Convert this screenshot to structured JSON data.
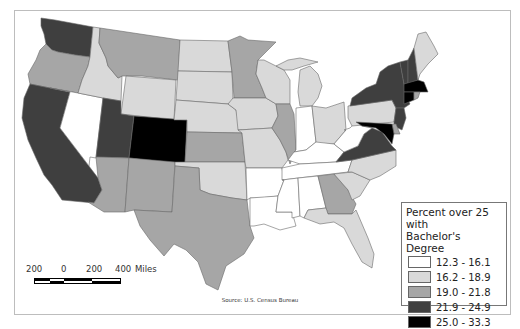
{
  "map": {
    "title_hidden": "",
    "source": "Source: U.S. Census Bureau"
  },
  "legend": {
    "title_line1": "Percent over 25 with",
    "title_line2": "Bachelor's Degree",
    "classes": [
      {
        "label": "12.3 - 16.1",
        "color": "#ffffff"
      },
      {
        "label": "16.2 - 18.9",
        "color": "#d9d9d9"
      },
      {
        "label": "19.0 - 21.8",
        "color": "#a6a6a6"
      },
      {
        "label": "21.9 - 24.9",
        "color": "#3f3f3f"
      },
      {
        "label": "25.0 - 33.3",
        "color": "#000000"
      }
    ]
  },
  "scale_bar": {
    "labels": [
      "200",
      "0",
      "200",
      "400"
    ],
    "unit": "Miles"
  },
  "states": {
    "WA": 3,
    "OR": 2,
    "CA": 3,
    "NV": 0,
    "ID": 1,
    "MT": 2,
    "WY": 1,
    "UT": 3,
    "CO": 4,
    "AZ": 2,
    "NM": 2,
    "ND": 1,
    "SD": 1,
    "NE": 1,
    "KS": 2,
    "OK": 1,
    "TX": 2,
    "MN": 2,
    "IA": 1,
    "MO": 1,
    "AR": 0,
    "LA": 0,
    "WI": 1,
    "IL": 2,
    "MI": 1,
    "IN": 0,
    "OH": 1,
    "KY": 0,
    "TN": 0,
    "MS": 0,
    "AL": 0,
    "GA": 2,
    "FL": 1,
    "SC": 1,
    "NC": 1,
    "VA": 3,
    "WV": 0,
    "PA": 1,
    "NY": 3,
    "VT": 3,
    "NH": 3,
    "ME": 1,
    "MA": 4,
    "CT": 4,
    "RI": 2,
    "NJ": 3,
    "DE": 2,
    "MD": 4
  }
}
